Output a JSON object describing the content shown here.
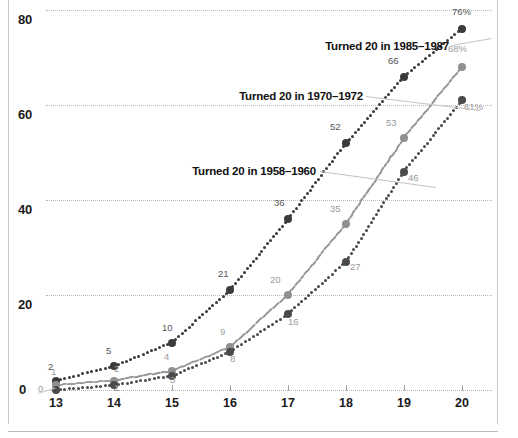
{
  "chart_data": {
    "type": "line",
    "title": "",
    "subtitle": "",
    "xlabel": "",
    "ylabel": "",
    "x": [
      13,
      14,
      15,
      16,
      17,
      18,
      19,
      20
    ],
    "xtick_labels": [
      "13",
      "14",
      "15",
      "16",
      "17",
      "18",
      "19",
      "20"
    ],
    "ytick_labels": [
      "0",
      "20",
      "40",
      "60",
      "80"
    ],
    "ylim": [
      0,
      84
    ],
    "xlim": [
      12.7,
      20.35
    ],
    "grid": "horizontal-dotted",
    "legend_position": "inline-annotations",
    "series": [
      {
        "name": "Turned 20 in 1985–1987",
        "color": "#3a3a3a",
        "style": "dotted",
        "values": [
          2,
          5,
          10,
          21,
          36,
          52,
          66,
          76
        ],
        "point_labels": [
          "2",
          "5",
          "10",
          "21",
          "36",
          "52",
          "66",
          "76%"
        ]
      },
      {
        "name": "Turned 20 in 1970–1972",
        "color": "#909090",
        "style": "dashed",
        "values": [
          1,
          2,
          4,
          9,
          20,
          35,
          53,
          68
        ],
        "point_labels": [
          "1",
          "2",
          "4",
          "9",
          "20",
          "35",
          "53",
          "68%"
        ]
      },
      {
        "name": "Turned 20 in 1958–1960",
        "color": "#4a4a4a",
        "style": "dotted",
        "values": [
          0,
          1,
          3,
          8,
          16,
          27,
          46,
          61
        ],
        "point_labels": [
          "0",
          "1",
          "3",
          "8",
          "16",
          "27",
          "46",
          "61%"
        ]
      }
    ],
    "annotations": [
      {
        "text": "Turned 20 in 1985–1987",
        "series": 0
      },
      {
        "text": "Turned 20 in 1970–1972",
        "series": 1
      },
      {
        "text": "Turned 20 in 1958–1960",
        "series": 2
      }
    ]
  },
  "axes": {
    "y_ticks": [
      {
        "label": "80",
        "value": 80
      },
      {
        "label": "60",
        "value": 60
      },
      {
        "label": "40",
        "value": 40
      },
      {
        "label": "20",
        "value": 20
      }
    ],
    "zero_label": "0",
    "x_ticks": [
      {
        "label": "13",
        "value": 13
      },
      {
        "label": "14",
        "value": 14
      },
      {
        "label": "15",
        "value": 15
      },
      {
        "label": "16",
        "value": 16
      },
      {
        "label": "17",
        "value": 17
      },
      {
        "label": "18",
        "value": 18
      },
      {
        "label": "19",
        "value": 19
      },
      {
        "label": "20",
        "value": 20
      }
    ]
  },
  "colors": {
    "series_high": "#3a3a3a",
    "series_mid": "#909090",
    "series_low": "#4a4a4a",
    "grid": "#b9b9b9",
    "label_gray": "#9a9a9a",
    "frame": "#c9c9c9"
  }
}
